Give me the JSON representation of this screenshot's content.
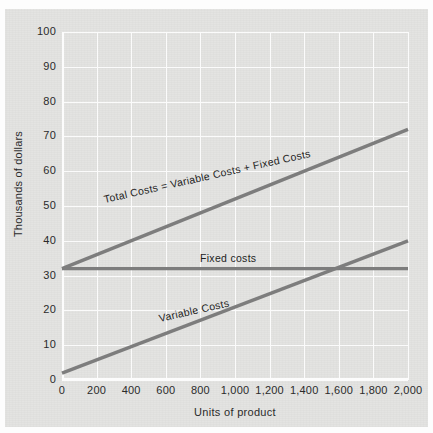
{
  "chart_data": {
    "type": "line",
    "title": "",
    "xlabel": "Units of product",
    "ylabel": "Thousands of dollars",
    "xlim": [
      0,
      2000
    ],
    "ylim": [
      0,
      100
    ],
    "grid": true,
    "legend": "inline-annotations",
    "x_ticks": [
      "0",
      "200",
      "400",
      "600",
      "800",
      "1,000",
      "1,200",
      "1,400",
      "1,600",
      "1,800",
      "2,000"
    ],
    "x_tick_values": [
      0,
      200,
      400,
      600,
      800,
      1000,
      1200,
      1400,
      1600,
      1800,
      2000
    ],
    "y_ticks": [
      "0",
      "10",
      "20",
      "30",
      "40",
      "50",
      "60",
      "70",
      "80",
      "90",
      "100"
    ],
    "y_tick_values": [
      0,
      10,
      20,
      30,
      40,
      50,
      60,
      70,
      80,
      90,
      100
    ],
    "series": [
      {
        "name": "Total Costs = Variable Costs + Fixed Costs",
        "label": "Total Costs = Variable Costs + Fixed Costs",
        "x": [
          0,
          2000
        ],
        "values": [
          32,
          72
        ],
        "color": "#7d7d7d"
      },
      {
        "name": "Fixed costs",
        "label": "Fixed costs",
        "x": [
          0,
          2000
        ],
        "values": [
          32,
          32
        ],
        "color": "#7d7d7d"
      },
      {
        "name": "Variable Costs",
        "label": "Variable Costs",
        "x": [
          0,
          2000
        ],
        "values": [
          2,
          40
        ],
        "color": "#7d7d7d"
      }
    ],
    "annotations": [
      {
        "text": "Total Costs = Variable Costs + Fixed Costs",
        "x": 430,
        "y": 44
      },
      {
        "text": "Fixed costs",
        "x": 1020,
        "y": 34
      },
      {
        "text": "Variable Costs",
        "x": 740,
        "y": 18
      }
    ],
    "colors": {
      "line": "#7d7d7d",
      "panel_background": "#e3e3e1",
      "gridline": "#fbfbfb",
      "text": "#2b2b2b",
      "page_background": "#fdfdfd"
    }
  },
  "axes": {
    "y_label": "Thousands of dollars",
    "x_label": "Units of product"
  }
}
